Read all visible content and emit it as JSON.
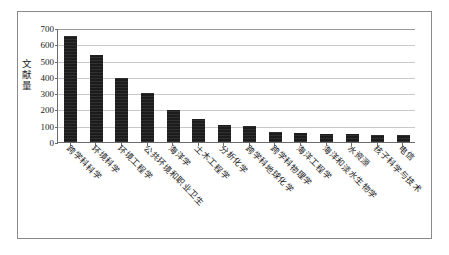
{
  "figure": {
    "border_color": "#8a8a8a",
    "background": "#ffffff"
  },
  "chart_data": {
    "type": "bar",
    "title": "",
    "xlabel": "",
    "ylabel": "文献量",
    "ylim": [
      0,
      700
    ],
    "yticks": [
      0,
      100,
      200,
      300,
      400,
      500,
      600,
      700
    ],
    "ytick_labels": [
      "0",
      "100",
      "200",
      "300",
      "400",
      "500",
      "600",
      "700"
    ],
    "grid": true,
    "legend": false,
    "bar_color": "#1c1c1c",
    "categories": [
      "跨学科科学",
      "环境科学",
      "环境工程学",
      "公共环境和职业卫生",
      "海洋学",
      "土木工程学",
      "分析化学",
      "跨学科地球化学",
      "跨学科物理学",
      "海洋工程学",
      "海洋和淡水生物学",
      "水资源",
      "核子科学与技术",
      "电信"
    ],
    "values": [
      650,
      535,
      395,
      300,
      197,
      143,
      102,
      97,
      62,
      58,
      51,
      48,
      44,
      41
    ]
  }
}
